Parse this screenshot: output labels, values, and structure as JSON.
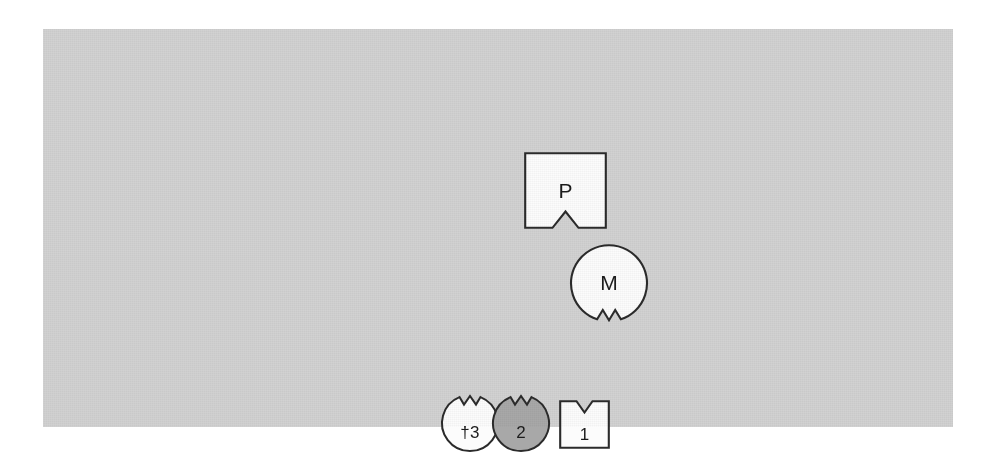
{
  "figure": {
    "panel": {
      "background_color": "#d2d2d2",
      "page_background_color": "#ffffff"
    },
    "style": {
      "outline_color": "#2b2b2b",
      "white_fill": "#fcfcfc",
      "gray_fill": "#a8a8a8",
      "label_color": "#1c1c1c"
    },
    "shapes": [
      {
        "id": "p",
        "label": "P",
        "form": "square",
        "fill": "white",
        "notch": "bottom",
        "notch_shape": "v-notch"
      },
      {
        "id": "m",
        "label": "M",
        "form": "circle",
        "fill": "white",
        "notch": "bottom",
        "notch_shape": "v-notch"
      },
      {
        "id": "three",
        "label": "†3",
        "form": "circle",
        "fill": "white",
        "notch": "top",
        "notch_shape": "v-notch"
      },
      {
        "id": "two",
        "label": "2",
        "form": "circle",
        "fill": "gray",
        "notch": "top",
        "notch_shape": "v-notch"
      },
      {
        "id": "one",
        "label": "1",
        "form": "square",
        "fill": "white",
        "notch": "top",
        "notch_shape": "v-notch"
      }
    ]
  }
}
